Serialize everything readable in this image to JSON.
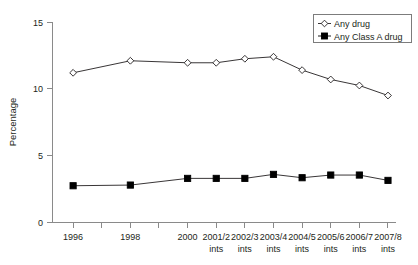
{
  "chart_data": {
    "type": "line",
    "title": "",
    "xlabel": "",
    "ylabel": "Percentage",
    "ylim": [
      0,
      15
    ],
    "yticks": [
      0,
      5,
      10,
      15
    ],
    "ytick_labels": [
      "0",
      "5",
      "10",
      "15"
    ],
    "grid": false,
    "legend_position": "top-right",
    "categories": [
      "1996",
      "1998",
      "2000",
      "2001/2 ints",
      "2002/3 ints",
      "2003/4 ints",
      "2004/5 ints",
      "2005/6 ints",
      "2006/7 ints",
      "2007/8 ints"
    ],
    "xtick_labels": [
      {
        "line1": "1996",
        "line2": ""
      },
      {
        "line1": "",
        "line2": ""
      },
      {
        "line1": "1998",
        "line2": ""
      },
      {
        "line1": "",
        "line2": ""
      },
      {
        "line1": "2000",
        "line2": ""
      },
      {
        "line1": "2001/2",
        "line2": "ints"
      },
      {
        "line1": "2002/3",
        "line2": "ints"
      },
      {
        "line1": "2003/4",
        "line2": "ints"
      },
      {
        "line1": "2004/5",
        "line2": "ints"
      },
      {
        "line1": "2005/6",
        "line2": "ints"
      },
      {
        "line1": "2006/7",
        "line2": "ints"
      },
      {
        "line1": "2007/8",
        "line2": "ints"
      }
    ],
    "series": [
      {
        "name": "Any drug",
        "marker": "open-diamond",
        "x_index": [
          0,
          2,
          4,
          5,
          6,
          7,
          8,
          9,
          10,
          11
        ],
        "values": [
          11.2,
          12.1,
          11.95,
          11.95,
          12.25,
          12.4,
          11.4,
          10.7,
          10.25,
          9.5
        ]
      },
      {
        "name": "Any Class A drug",
        "marker": "filled-square",
        "x_index": [
          0,
          2,
          4,
          5,
          6,
          7,
          8,
          9,
          10,
          11
        ],
        "values": [
          2.75,
          2.8,
          3.3,
          3.3,
          3.3,
          3.6,
          3.35,
          3.55,
          3.55,
          3.15
        ]
      }
    ],
    "legend": [
      "Any drug",
      "Any Class A drug"
    ]
  },
  "colors": {
    "axis": "#8a8a8a",
    "series_any_drug": "#231f20",
    "series_class_a": "#000000",
    "background": "#ffffff",
    "legend_border": "#6e6e6e"
  }
}
